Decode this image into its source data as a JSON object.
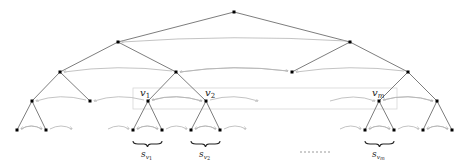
{
  "diagram": {
    "type": "binary-tree-with-sibling-pointers",
    "nodes": {
      "root": [
        234,
        12
      ],
      "level1": [
        [
          118,
          42
        ],
        [
          350,
          42
        ]
      ],
      "level2": [
        [
          60,
          72
        ],
        [
          176,
          72
        ],
        [
          292,
          72
        ],
        [
          408,
          72
        ]
      ],
      "level3": [
        [
          32,
          101
        ],
        [
          90,
          101
        ],
        [
          148,
          101
        ],
        [
          206,
          101
        ],
        [
          379,
          101
        ],
        [
          437,
          101
        ]
      ],
      "level4": [
        [
          17,
          130
        ],
        [
          46,
          130
        ],
        [
          133,
          130
        ],
        [
          162,
          130
        ],
        [
          191,
          130
        ],
        [
          220,
          130
        ],
        [
          365,
          130
        ],
        [
          394,
          130
        ],
        [
          423,
          130
        ],
        [
          452,
          130
        ]
      ]
    },
    "labels": {
      "v1": "v",
      "v1_sub": "1",
      "v2": "v",
      "v2_sub": "2",
      "vm": "v",
      "vm_sub": "m",
      "s1": "s",
      "s1_sub": "v",
      "s1_subsub": "1",
      "s2": "s",
      "s2_sub": "v",
      "s2_subsub": "2",
      "sm": "s",
      "sm_sub": "v",
      "sm_subsub": "m"
    },
    "colors": {
      "edge": "#6e6e6e",
      "pointer": "#b4b4b4",
      "node": "#000000",
      "highlight_box": "#d6d6d6"
    }
  }
}
